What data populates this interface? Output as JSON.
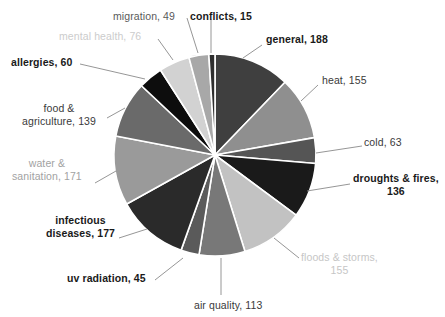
{
  "chart_data": {
    "type": "pie",
    "title": "",
    "subtitle": "",
    "xlabel": "",
    "ylabel": "",
    "legend_position": "none",
    "grid": false,
    "total": 1542,
    "label_format": "{name}, {value}",
    "categories": [
      "general",
      "heat",
      "cold",
      "droughts & fires",
      "floods & storms",
      "air quality",
      "uv radiation",
      "infectious diseases",
      "water & sanitation",
      "food & agriculture",
      "allergies",
      "mental health",
      "migration",
      "conflicts"
    ],
    "values": [
      188,
      155,
      63,
      136,
      155,
      113,
      45,
      177,
      171,
      139,
      60,
      76,
      49,
      15
    ],
    "colors": [
      "#3f3f3f",
      "#8f8f8f",
      "#555555",
      "#1a1a1a",
      "#c2c2c2",
      "#787878",
      "#5a5a5a",
      "#2a2a2a",
      "#9a9a9a",
      "#6a6a6a",
      "#0d0d0d",
      "#d2d2d2",
      "#a8a8a8",
      "#2e2e2e"
    ],
    "slice_separator_color": "#ffffff",
    "start_angle_deg": -90,
    "direction": "clockwise"
  },
  "labels": [
    {
      "id": "general",
      "text": "general, 188",
      "name": "general",
      "value": 188,
      "color": "#1a1a1a",
      "bold": true,
      "x": 266,
      "y": 33,
      "align": "left",
      "leader": {
        "x1": 262,
        "y1": 45,
        "x2": 243,
        "y2": 58
      }
    },
    {
      "id": "heat",
      "text": "heat, 155",
      "name": "heat",
      "value": 155,
      "color": "#3a3a3a",
      "bold": false,
      "x": 322,
      "y": 74,
      "align": "left",
      "leader": {
        "x1": 318,
        "y1": 85,
        "x2": 301,
        "y2": 101
      }
    },
    {
      "id": "cold",
      "text": "cold, 63",
      "name": "cold",
      "value": 63,
      "color": "#3a3a3a",
      "bold": false,
      "x": 364,
      "y": 136,
      "align": "left",
      "leader": {
        "x1": 362,
        "y1": 146,
        "x2": 316,
        "y2": 153
      }
    },
    {
      "id": "droughts-fires",
      "text": "droughts & fires,\n136",
      "name": "droughts & fires",
      "value": 136,
      "color": "#1a1a1a",
      "bold": true,
      "x": 353,
      "y": 172,
      "align": "left",
      "leader": {
        "x1": 350,
        "y1": 184,
        "x2": 307,
        "y2": 191
      }
    },
    {
      "id": "floods-storms",
      "text": "floods & storms,\n155",
      "name": "floods & storms",
      "value": 155,
      "color": "#c6c6c6",
      "bold": false,
      "x": 301,
      "y": 251,
      "align": "left",
      "leader": {
        "x1": 299,
        "y1": 258,
        "x2": 274,
        "y2": 238
      }
    },
    {
      "id": "air-quality",
      "text": "air quality, 113",
      "name": "air quality",
      "value": 113,
      "color": "#3a3a3a",
      "bold": false,
      "x": 194,
      "y": 299,
      "align": "left",
      "leader": {
        "x1": 221,
        "y1": 295,
        "x2": 221,
        "y2": 258
      }
    },
    {
      "id": "uv-radiation",
      "text": "uv radiation, 45",
      "name": "uv radiation",
      "value": 45,
      "color": "#1a1a1a",
      "bold": true,
      "x": 67,
      "y": 272,
      "align": "left",
      "leader": {
        "x1": 155,
        "y1": 280,
        "x2": 183,
        "y2": 258
      }
    },
    {
      "id": "infectious-diseases",
      "text": "infectious\ndiseases, 177",
      "name": "infectious diseases",
      "value": 177,
      "color": "#1a1a1a",
      "bold": true,
      "x": 46,
      "y": 214,
      "align": "left",
      "leader": {
        "x1": 119,
        "y1": 238,
        "x2": 147,
        "y2": 229
      }
    },
    {
      "id": "water-sanitation",
      "text": "water &\nsanitation, 171",
      "name": "water & sanitation",
      "value": 171,
      "color": "#a2a2a2",
      "bold": false,
      "x": 12,
      "y": 157,
      "align": "left",
      "leader": {
        "x1": 95,
        "y1": 183,
        "x2": 116,
        "y2": 171
      }
    },
    {
      "id": "food-agriculture",
      "text": "food &\nagriculture, 139",
      "name": "food & agriculture",
      "value": 139,
      "color": "#3a3a3a",
      "bold": false,
      "x": 22,
      "y": 102,
      "align": "left",
      "leader": {
        "x1": 107,
        "y1": 118,
        "x2": 125,
        "y2": 108
      }
    },
    {
      "id": "allergies",
      "text": "allergies, 60",
      "name": "allergies",
      "value": 60,
      "color": "#1a1a1a",
      "bold": true,
      "x": 11,
      "y": 56,
      "align": "left",
      "leader": {
        "x1": 80,
        "y1": 64,
        "x2": 145,
        "y2": 79
      }
    },
    {
      "id": "mental-health",
      "text": "mental health, 76",
      "name": "mental health",
      "value": 76,
      "color": "#cccccc",
      "bold": false,
      "x": 59,
      "y": 30,
      "align": "left",
      "leader": {
        "x1": 158,
        "y1": 39,
        "x2": 173,
        "y2": 60
      }
    },
    {
      "id": "migration",
      "text": "migration, 49",
      "name": "migration",
      "value": 49,
      "color": "#5a5a5a",
      "bold": false,
      "x": 113,
      "y": 10,
      "align": "left",
      "leader": {
        "x1": 187,
        "y1": 18,
        "x2": 198,
        "y2": 53
      }
    },
    {
      "id": "conflicts",
      "text": "conflicts, 15",
      "name": "conflicts",
      "value": 15,
      "color": "#1a1a1a",
      "bold": true,
      "x": 190,
      "y": 10,
      "align": "left",
      "leader": {
        "x1": 211,
        "y1": 19,
        "x2": 211,
        "y2": 53
      }
    }
  ],
  "geometry": {
    "cx": 215,
    "cy": 155,
    "r": 101
  }
}
